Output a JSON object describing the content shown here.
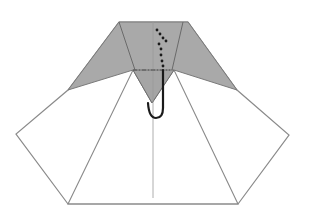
{
  "diagram": {
    "type": "origami-fold-step",
    "colors": {
      "background": "#ffffff",
      "paper_white": "#ffffff",
      "paper_colored": "#a9a9a9",
      "edge": "#8a8a8a",
      "crease": "#9a9a9a",
      "arrow": "#1a1a1a"
    },
    "shapes": {
      "white_outline": "119,22 188,22 237,90 289,135 238,204 68,204 16,134 68,90",
      "white_inner_triangle": "133,70 174,70 238,204 68,204",
      "grey_top": "119,22 188,22 237,90 174,70 152,103 133,70 68,90",
      "grey_front_flap": "133,70 174,70 152,103"
    },
    "lines": {
      "center_crease": {
        "x1": 153,
        "y1": 22,
        "x2": 153,
        "y2": 198
      },
      "left_crease": {
        "x1": 119,
        "y1": 22,
        "x2": 135,
        "y2": 70
      },
      "right_crease": {
        "x1": 183,
        "y1": 22,
        "x2": 172,
        "y2": 70
      },
      "valley_fold": {
        "x1": 133,
        "y1": 70,
        "x2": 170,
        "y2": 70
      }
    },
    "arrow": {
      "dots": [
        [
          157,
          30
        ],
        [
          160,
          34
        ],
        [
          163,
          38
        ],
        [
          166,
          41
        ],
        [
          159,
          44
        ],
        [
          161,
          49
        ],
        [
          161,
          55
        ],
        [
          162,
          61
        ],
        [
          163,
          66
        ]
      ],
      "hook_path": "M163,70 L163,108 Q163,118 156,118 Q149,118 148,103"
    }
  }
}
